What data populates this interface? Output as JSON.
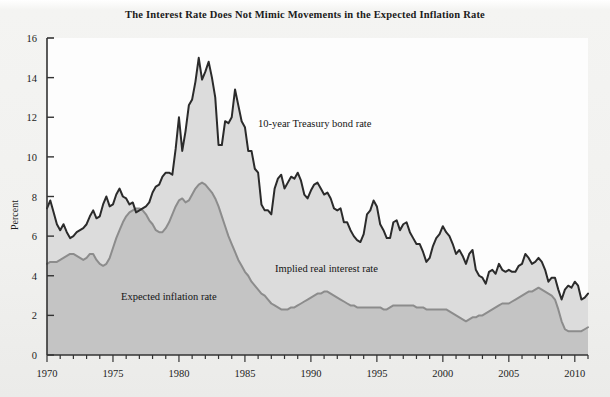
{
  "figure": {
    "title": "The Interest Rate Does Not Mimic Movements in the Expected Inflation Rate",
    "background_color": "#f1f1ef",
    "plot_background_color": "#fefefe"
  },
  "axes": {
    "y_title": "Percent",
    "y_ticks": [
      "16",
      "14",
      "12",
      "10",
      "8",
      "6",
      "4",
      "2",
      "0"
    ],
    "x_ticks": [
      "1970",
      "1975",
      "1980",
      "1985",
      "1990",
      "1995",
      "2000",
      "2005",
      "2010"
    ]
  },
  "annotations": {
    "treasury": "10-year Treasury bond rate",
    "implied_real": "Implied real interest rate",
    "expected_inflation": "Expected inflation rate"
  },
  "chart_data": {
    "type": "area",
    "title": "The Interest Rate Does Not Mimic Movements in the Expected Inflation Rate",
    "xlabel": "",
    "ylabel": "Percent",
    "xlim": [
      1970,
      2011
    ],
    "ylim": [
      0,
      16
    ],
    "ytick_step": 2,
    "xtick_major_step": 5,
    "xtick_minor_step": 1,
    "grid": false,
    "legend": "inline annotations",
    "colors": {
      "treasury_line": "#2b2b2b",
      "inflation_line": "#8c8c8c",
      "inflation_fill": "#c4c4c4",
      "real_rate_fill": "#dcdcdc"
    },
    "x": [
      1970.0,
      1970.25,
      1970.5,
      1970.75,
      1971.0,
      1971.25,
      1971.5,
      1971.75,
      1972.0,
      1972.25,
      1972.5,
      1972.75,
      1973.0,
      1973.25,
      1973.5,
      1973.75,
      1974.0,
      1974.25,
      1974.5,
      1974.75,
      1975.0,
      1975.25,
      1975.5,
      1975.75,
      1976.0,
      1976.25,
      1976.5,
      1976.75,
      1977.0,
      1977.25,
      1977.5,
      1977.75,
      1978.0,
      1978.25,
      1978.5,
      1978.75,
      1979.0,
      1979.25,
      1979.5,
      1979.75,
      1980.0,
      1980.25,
      1980.5,
      1980.75,
      1981.0,
      1981.25,
      1981.5,
      1981.75,
      1982.0,
      1982.25,
      1982.5,
      1982.75,
      1983.0,
      1983.25,
      1983.5,
      1983.75,
      1984.0,
      1984.25,
      1984.5,
      1984.75,
      1985.0,
      1985.25,
      1985.5,
      1985.75,
      1986.0,
      1986.25,
      1986.5,
      1986.75,
      1987.0,
      1987.25,
      1987.5,
      1987.75,
      1988.0,
      1988.25,
      1988.5,
      1988.75,
      1989.0,
      1989.25,
      1989.5,
      1989.75,
      1990.0,
      1990.25,
      1990.5,
      1990.75,
      1991.0,
      1991.25,
      1991.5,
      1991.75,
      1992.0,
      1992.25,
      1992.5,
      1992.75,
      1993.0,
      1993.25,
      1993.5,
      1993.75,
      1994.0,
      1994.25,
      1994.5,
      1994.75,
      1995.0,
      1995.25,
      1995.5,
      1995.75,
      1996.0,
      1996.25,
      1996.5,
      1996.75,
      1997.0,
      1997.25,
      1997.5,
      1997.75,
      1998.0,
      1998.25,
      1998.5,
      1998.75,
      1999.0,
      1999.25,
      1999.5,
      1999.75,
      2000.0,
      2000.25,
      2000.5,
      2000.75,
      2001.0,
      2001.25,
      2001.5,
      2001.75,
      2002.0,
      2002.25,
      2002.5,
      2002.75,
      2003.0,
      2003.25,
      2003.5,
      2003.75,
      2004.0,
      2004.25,
      2004.5,
      2004.75,
      2005.0,
      2005.25,
      2005.5,
      2005.75,
      2006.0,
      2006.25,
      2006.5,
      2006.75,
      2007.0,
      2007.25,
      2007.5,
      2007.75,
      2008.0,
      2008.25,
      2008.5,
      2008.75,
      2009.0,
      2009.25,
      2009.5,
      2009.75,
      2010.0,
      2010.25,
      2010.5,
      2010.75,
      2011.0
    ],
    "series": [
      {
        "name": "10-year Treasury bond rate",
        "type": "line",
        "color": "#2b2b2b",
        "values": [
          7.4,
          7.8,
          7.2,
          6.6,
          6.3,
          6.6,
          6.2,
          5.9,
          6.0,
          6.2,
          6.3,
          6.4,
          6.6,
          7.0,
          7.3,
          6.9,
          7.0,
          7.6,
          8.0,
          7.5,
          7.6,
          8.1,
          8.4,
          8.0,
          7.9,
          7.6,
          7.7,
          7.2,
          7.3,
          7.4,
          7.5,
          7.7,
          8.2,
          8.5,
          8.6,
          9.0,
          9.2,
          9.2,
          9.1,
          10.4,
          12.0,
          10.3,
          11.3,
          12.6,
          12.9,
          13.8,
          15.0,
          13.9,
          14.3,
          14.8,
          14.0,
          13.0,
          10.6,
          10.6,
          11.8,
          11.7,
          12.0,
          13.4,
          12.6,
          11.8,
          11.5,
          10.3,
          10.3,
          9.4,
          9.2,
          7.6,
          7.3,
          7.3,
          7.1,
          8.4,
          8.9,
          9.1,
          8.4,
          8.7,
          9.0,
          8.9,
          9.2,
          8.8,
          8.1,
          7.9,
          8.3,
          8.6,
          8.7,
          8.4,
          8.1,
          8.2,
          7.9,
          7.4,
          7.3,
          7.4,
          6.7,
          6.7,
          6.3,
          6.0,
          5.8,
          5.7,
          6.1,
          7.1,
          7.3,
          7.8,
          7.5,
          6.6,
          6.3,
          5.9,
          5.9,
          6.7,
          6.8,
          6.3,
          6.6,
          6.7,
          6.2,
          5.9,
          5.6,
          5.6,
          5.2,
          4.7,
          4.9,
          5.5,
          5.9,
          6.1,
          6.5,
          6.2,
          6.0,
          5.6,
          5.1,
          5.3,
          5.0,
          4.6,
          5.1,
          5.3,
          4.3,
          4.0,
          3.9,
          3.6,
          4.2,
          4.3,
          4.1,
          4.6,
          4.3,
          4.2,
          4.3,
          4.2,
          4.2,
          4.5,
          4.6,
          5.1,
          4.9,
          4.6,
          4.7,
          4.9,
          4.7,
          4.3,
          3.7,
          3.9,
          3.9,
          3.3,
          2.8,
          3.3,
          3.5,
          3.4,
          3.7,
          3.5,
          2.8,
          2.9,
          3.1
        ]
      },
      {
        "name": "Expected inflation rate",
        "type": "area",
        "color": "#8c8c8c",
        "fill": "#c4c4c4",
        "values": [
          4.6,
          4.7,
          4.7,
          4.7,
          4.8,
          4.9,
          5.0,
          5.1,
          5.1,
          5.0,
          4.9,
          4.8,
          4.9,
          5.1,
          5.1,
          4.8,
          4.6,
          4.5,
          4.6,
          4.9,
          5.4,
          5.9,
          6.3,
          6.7,
          7.0,
          7.2,
          7.3,
          7.4,
          7.4,
          7.3,
          7.1,
          6.8,
          6.6,
          6.3,
          6.2,
          6.2,
          6.4,
          6.7,
          7.1,
          7.5,
          7.8,
          7.9,
          7.7,
          7.8,
          8.1,
          8.4,
          8.6,
          8.7,
          8.6,
          8.4,
          8.2,
          7.9,
          7.5,
          7.0,
          6.5,
          6.0,
          5.6,
          5.2,
          4.8,
          4.5,
          4.2,
          4.0,
          3.7,
          3.5,
          3.3,
          3.1,
          3.0,
          2.8,
          2.6,
          2.5,
          2.4,
          2.3,
          2.3,
          2.3,
          2.4,
          2.4,
          2.5,
          2.6,
          2.7,
          2.8,
          2.9,
          3.0,
          3.1,
          3.1,
          3.2,
          3.2,
          3.1,
          3.0,
          2.9,
          2.8,
          2.7,
          2.6,
          2.5,
          2.5,
          2.4,
          2.4,
          2.4,
          2.4,
          2.4,
          2.4,
          2.4,
          2.4,
          2.3,
          2.3,
          2.4,
          2.5,
          2.5,
          2.5,
          2.5,
          2.5,
          2.5,
          2.5,
          2.4,
          2.4,
          2.4,
          2.3,
          2.3,
          2.3,
          2.3,
          2.3,
          2.3,
          2.3,
          2.2,
          2.1,
          2.0,
          1.9,
          1.8,
          1.7,
          1.8,
          1.9,
          1.9,
          2.0,
          2.0,
          2.1,
          2.2,
          2.3,
          2.4,
          2.5,
          2.6,
          2.6,
          2.6,
          2.7,
          2.8,
          2.9,
          3.0,
          3.1,
          3.2,
          3.2,
          3.3,
          3.4,
          3.3,
          3.2,
          3.1,
          3.0,
          2.8,
          2.3,
          1.7,
          1.3,
          1.2,
          1.2,
          1.2,
          1.2,
          1.2,
          1.3,
          1.4
        ]
      }
    ]
  }
}
